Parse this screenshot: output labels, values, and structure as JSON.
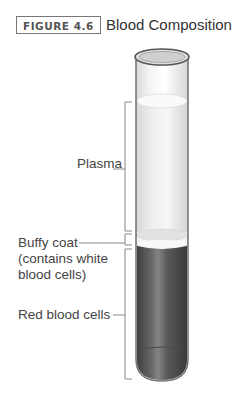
{
  "figure": {
    "badge": "FIGURE 4.6",
    "title": "Blood Composition"
  },
  "labels": {
    "plasma": "Plasma",
    "buffy_coat_line1": "Buffy coat",
    "buffy_coat_line2": "(contains white",
    "buffy_coat_line3": "blood cells)",
    "red_blood_cells": "Red blood cells"
  },
  "colors": {
    "plasma": "#ececec",
    "buffy_coat": "#f5f5f5",
    "red_blood_cells": "#555555",
    "tube_outline": "#666666",
    "bracket": "#888888"
  }
}
